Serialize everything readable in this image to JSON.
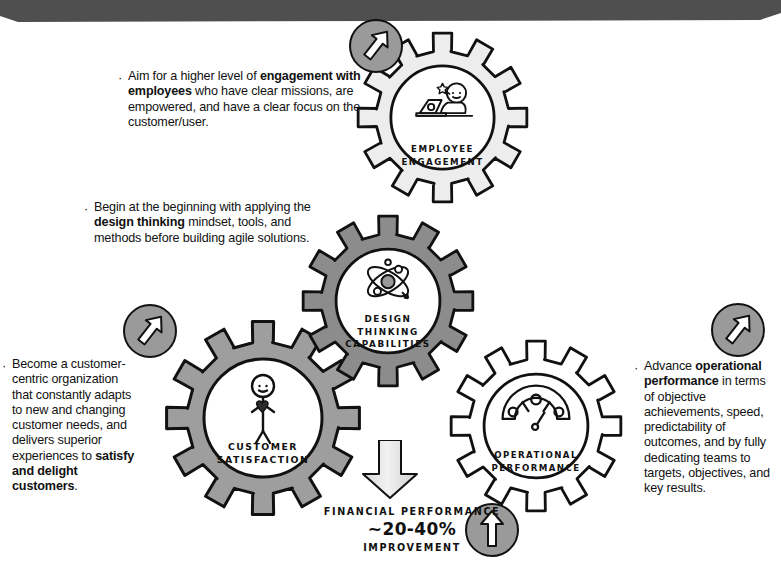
{
  "banner": {
    "name": "top-banner",
    "color": "#4f4f4f"
  },
  "palette": {
    "gear_dark": "#8c8c8c",
    "gear_mid": "#9e9e9e",
    "gear_light": "#ededed",
    "gear_white": "#ffffff",
    "badge_fill": "#9a9a9a",
    "arrow_fill": "#e9e9e9",
    "outline": "#111111",
    "text": "#111111"
  },
  "callouts": [
    {
      "id": "employee",
      "bullet": "·",
      "segments": [
        {
          "text": "Aim for a higher level of ",
          "bold": false
        },
        {
          "text": "engagement with employees",
          "bold": true
        },
        {
          "text": " who have clear missions, are empowered, and have a clear focus on the customer/user.",
          "bold": false
        }
      ]
    },
    {
      "id": "design",
      "bullet": "·",
      "segments": [
        {
          "text": "Begin at the beginning with applying the ",
          "bold": false
        },
        {
          "text": "design thinking",
          "bold": true
        },
        {
          "text": " mindset, tools, and methods before building agile solutions.",
          "bold": false
        }
      ]
    },
    {
      "id": "customer",
      "bullet": "·",
      "segments": [
        {
          "text": "Become a customer-centric organization that constantly adapts to new and changing customer needs, and delivers superior experiences to ",
          "bold": false
        },
        {
          "text": "satisfy and delight customers",
          "bold": true
        },
        {
          "text": ".",
          "bold": false
        }
      ]
    },
    {
      "id": "opperf",
      "bullet": "·",
      "segments": [
        {
          "text": "Advance ",
          "bold": false
        },
        {
          "text": "operational performance",
          "bold": true
        },
        {
          "text": " in terms of objective achievements, speed, predictability of outcomes, and by fully dedicating teams to targets, objectives, and key results.",
          "bold": false
        }
      ]
    }
  ],
  "gears": {
    "employee_engagement": {
      "label_lines": [
        "EMPLOYEE",
        "ENGAGEMENT"
      ],
      "icon": "person-at-laptop-icon",
      "fill": "#ededed"
    },
    "design_thinking": {
      "label_lines": [
        "DESIGN",
        "THINKING",
        "CAPABILITIES"
      ],
      "icon": "atom-icon",
      "fill": "#8c8c8c"
    },
    "customer_satisfaction": {
      "label_lines": [
        "CUSTOMER",
        "SATISFACTION"
      ],
      "icon": "person-holding-heart-icon",
      "fill": "#9e9e9e"
    },
    "operational_performance": {
      "label_lines": [
        "OPERATIONAL",
        "PERFORMANCE"
      ],
      "icon": "gauge-icon",
      "fill": "#ffffff"
    }
  },
  "badges": [
    {
      "id": "badge-top",
      "icon": "arrow-up-right-icon"
    },
    {
      "id": "badge-left",
      "icon": "arrow-up-right-icon"
    },
    {
      "id": "badge-right",
      "icon": "arrow-up-right-icon"
    },
    {
      "id": "badge-bottom",
      "icon": "arrow-up-icon"
    }
  ],
  "down_arrow": {
    "icon": "arrow-down-icon"
  },
  "financial": {
    "title": "FINANCIAL PERFORMANCE",
    "value": "~20-40%",
    "subtitle": "IMPROVEMENT"
  }
}
